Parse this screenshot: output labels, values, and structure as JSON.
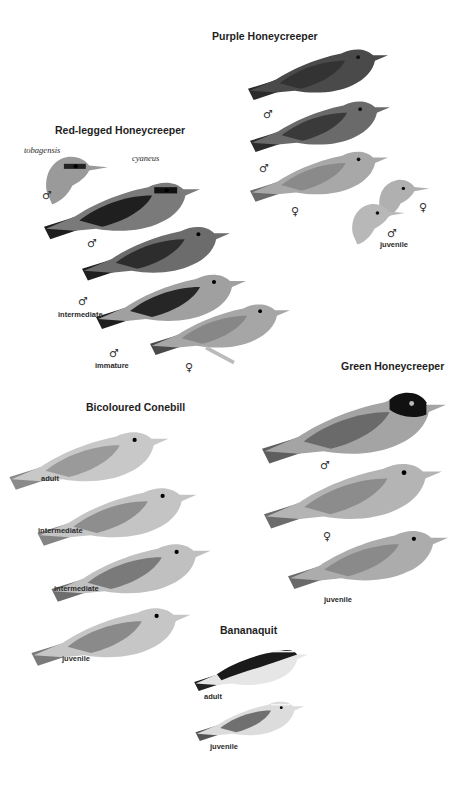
{
  "plate": {
    "species": [
      {
        "name": "Purple Honeycreeper",
        "figures": [
          {
            "sex": "♂",
            "label": ""
          },
          {
            "sex": "♂",
            "label": ""
          },
          {
            "sex": "♀",
            "label": ""
          },
          {
            "sex": "♀",
            "label": ""
          },
          {
            "sex": "♂",
            "label": "juvenile"
          }
        ]
      },
      {
        "name": "Red-legged Honeycreeper",
        "subspecies": [
          "tobagensis",
          "cyaneus"
        ],
        "figures": [
          {
            "sex": "♂",
            "label": "",
            "subspecies": "tobagensis"
          },
          {
            "sex": "♂",
            "label": "",
            "subspecies": "cyaneus"
          },
          {
            "sex": "♂",
            "label": "intermediate"
          },
          {
            "sex": "♂",
            "label": "immature"
          },
          {
            "sex": "♀",
            "label": ""
          }
        ]
      },
      {
        "name": "Green Honeycreeper",
        "figures": [
          {
            "sex": "♂",
            "label": ""
          },
          {
            "sex": "♀",
            "label": ""
          },
          {
            "sex": "",
            "label": "juvenile"
          }
        ]
      },
      {
        "name": "Bicoloured Conebill",
        "figures": [
          {
            "sex": "",
            "label": "adult"
          },
          {
            "sex": "",
            "label": "intermediate"
          },
          {
            "sex": "",
            "label": "intermediate"
          },
          {
            "sex": "",
            "label": "juvenile"
          }
        ]
      },
      {
        "name": "Bananaquit",
        "figures": [
          {
            "sex": "",
            "label": "adult"
          },
          {
            "sex": "",
            "label": "juvenile"
          }
        ]
      }
    ]
  },
  "symbols": {
    "male": "♂",
    "female": "♀"
  }
}
